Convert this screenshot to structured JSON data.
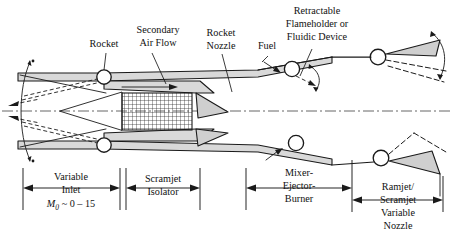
{
  "figure": {
    "colors": {
      "line": "#1a1a1a",
      "shade": "#d9d9d9",
      "centerline": "#555555",
      "background": "#ffffff"
    }
  },
  "callouts": {
    "rocket": "Rocket",
    "secondary_air_flow_line1": "Secondary",
    "secondary_air_flow_line2": "Air Flow",
    "rocket_nozzle_line1": "Rocket",
    "rocket_nozzle_line2": "Nozzle",
    "fuel": "Fuel",
    "retractable_line1": "Retractable",
    "retractable_line2": "Flameholder or",
    "retractable_line3": "Fluidic Device"
  },
  "stations": [
    {
      "id": "variable-inlet",
      "line1": "Variable",
      "line2": "Inlet",
      "mach_symbol": "M",
      "mach_subscript": "0",
      "mach_value": "~ 0 – 15"
    },
    {
      "id": "scramjet-isolator",
      "line1": "Scramjet",
      "line2": "Isolator"
    },
    {
      "id": "mixer-ejector-burner",
      "line1": "Mixer-",
      "line2": "Ejector-",
      "line3": "Burner"
    },
    {
      "id": "ramjet-scramjet-variable-nozzle",
      "line1": "Ramjet/",
      "line2": "Scramjet",
      "line3": "Variable",
      "line4": "Nozzle"
    }
  ]
}
